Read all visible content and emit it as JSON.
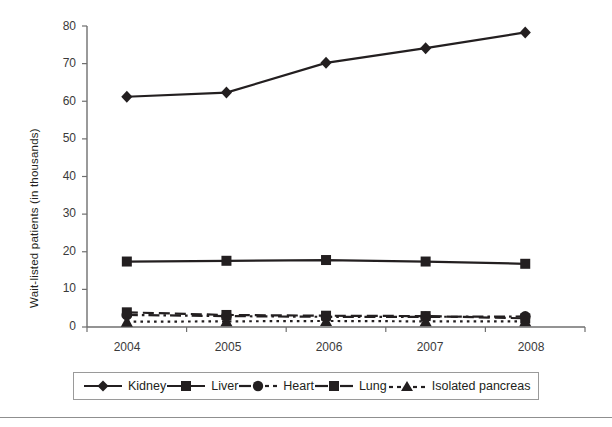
{
  "chart_data": {
    "type": "line",
    "title": "",
    "xlabel": "",
    "ylabel": "Wait-listed patients (in thousands)",
    "categories": [
      "2004",
      "2005",
      "2006",
      "2007",
      "2008"
    ],
    "ylim": [
      0,
      80
    ],
    "yticks": [
      0,
      10,
      20,
      30,
      40,
      50,
      60,
      70,
      80
    ],
    "ytick_labels": [
      "0",
      "10",
      "20",
      "30",
      "40",
      "50",
      "60",
      "70",
      "80"
    ],
    "grid": false,
    "legend_position": "bottom",
    "series": [
      {
        "name": "Kidney",
        "marker": "diamond",
        "line_style": "solid",
        "color": "#231f20",
        "values": [
          61.2,
          62.3,
          70.2,
          74.1,
          78.3
        ]
      },
      {
        "name": "Liver",
        "marker": "square",
        "line_style": "solid",
        "color": "#231f20",
        "values": [
          17.4,
          17.6,
          17.8,
          17.4,
          16.8
        ]
      },
      {
        "name": "Heart",
        "marker": "circle",
        "line_style": "dash-dot",
        "color": "#231f20",
        "values": [
          3.2,
          2.9,
          2.7,
          2.7,
          2.8
        ]
      },
      {
        "name": "Lung",
        "marker": "square",
        "line_style": "dashed",
        "color": "#231f20",
        "values": [
          3.9,
          3.2,
          3.0,
          2.9,
          2.3
        ]
      },
      {
        "name": "Isolated pancreas",
        "marker": "triangle",
        "line_style": "dotted",
        "color": "#231f20",
        "values": [
          1.4,
          1.5,
          1.6,
          1.5,
          1.5
        ]
      }
    ]
  },
  "legend": {
    "items": [
      {
        "label": "Kidney",
        "marker": "diamond-marker-icon"
      },
      {
        "label": "Liver",
        "marker": "square-marker-icon"
      },
      {
        "label": "Heart",
        "marker": "circle-marker-icon"
      },
      {
        "label": "Lung",
        "marker": "square-marker-icon"
      },
      {
        "label": "Isolated pancreas",
        "marker": "triangle-marker-icon"
      }
    ]
  },
  "colors": {
    "ink": "#231f20",
    "axis": "#6f6f6f",
    "tick_text": "#3a3a3a",
    "legend_border": "#9a9a9a",
    "rule": "#8f8f8f",
    "background": "#ffffff"
  }
}
